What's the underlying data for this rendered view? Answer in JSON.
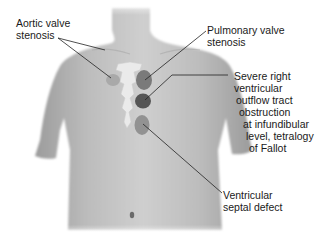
{
  "figure": {
    "colors": {
      "skin": "#b5b5b5",
      "skin_light": "#d6d6d6",
      "skin_dark": "#9a9a9a",
      "sternum": "#eeeeee",
      "aortic_valve": "#aaaaaa",
      "pulmonary_valve": "#777777",
      "rvot_obstruction": "#555555",
      "vsd": "#8e8e8e",
      "leader_line": "#222222",
      "text": "#1a1a1a"
    }
  },
  "labels": {
    "aortic": [
      "Aortic valve",
      "stenosis"
    ],
    "pulmonary": [
      "Pulmonary valve",
      "stenosis"
    ],
    "rvot": [
      "Severe right",
      "ventricular",
      "outflow tract",
      "obstruction",
      "at infundibular",
      "level, tetralogy",
      "of Fallot"
    ],
    "vsd": [
      "Ventricular",
      "septal defect"
    ]
  }
}
